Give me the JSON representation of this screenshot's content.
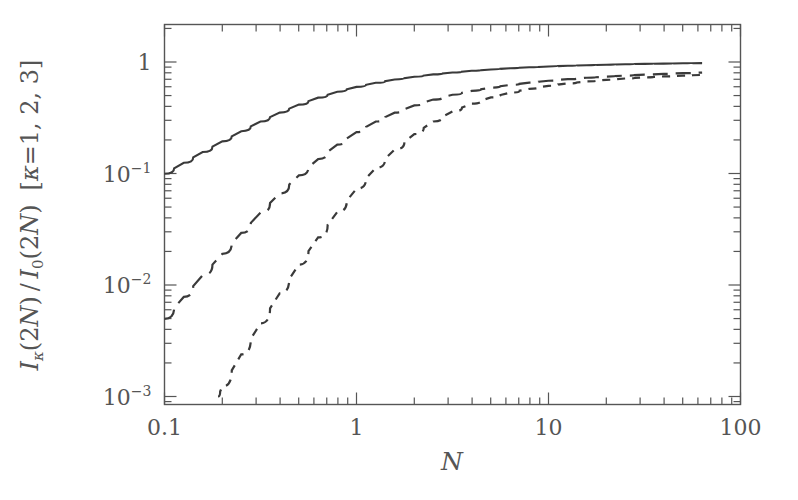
{
  "figure": {
    "background_color": "#ffffff",
    "frame_color": "#555555",
    "curve_color": "#3a3a3a"
  },
  "chart_data": {
    "type": "line",
    "title": "",
    "subtitle": "",
    "xlabel": "N",
    "ylabel": "I_κ(2N)/I_0(2N)  [κ=1, 2, 3]",
    "xscale": "log",
    "yscale": "log",
    "xlim": [
      0.1,
      100
    ],
    "ylim": [
      0.001,
      1.6
    ],
    "grid": false,
    "legend": "none",
    "xticks": [
      0.1,
      1,
      10,
      100
    ],
    "xtick_labels": [
      "0.1",
      "1",
      "10",
      "100"
    ],
    "yticks": [
      1,
      0.1,
      0.01,
      0.001
    ],
    "ytick_labels": [
      "1",
      "10⁻¹",
      "10⁻²",
      "10⁻³"
    ],
    "ytick_mantissas": [
      "1",
      "10",
      "10",
      "10"
    ],
    "ytick_exponents": [
      "",
      "-1",
      "-2",
      "-3"
    ],
    "minor_ticks": true,
    "series": [
      {
        "name": "κ = 1",
        "linestyle": "solid",
        "x": [
          0.1,
          0.126,
          0.158,
          0.2,
          0.251,
          0.316,
          0.398,
          0.501,
          0.631,
          0.794,
          1.0,
          1.26,
          1.58,
          2.0,
          2.51,
          3.16,
          3.98,
          5.01,
          6.31,
          7.94,
          10.0,
          12.6,
          15.8,
          20.0,
          25.1,
          31.6,
          39.8,
          50.1,
          63.1
        ],
        "y": [
          0.0995,
          0.1249,
          0.1558,
          0.1942,
          0.2395,
          0.2925,
          0.3517,
          0.4149,
          0.4789,
          0.5412,
          0.5984,
          0.6506,
          0.6968,
          0.7378,
          0.7741,
          0.8058,
          0.8335,
          0.8576,
          0.8783,
          0.8963,
          0.9117,
          0.9251,
          0.9365,
          0.9462,
          0.9546,
          0.9617,
          0.9678,
          0.9731,
          0.9775
        ]
      },
      {
        "name": "κ = 2",
        "linestyle": "long-dash",
        "x": [
          0.1,
          0.126,
          0.158,
          0.2,
          0.251,
          0.316,
          0.398,
          0.501,
          0.631,
          0.794,
          1.0,
          1.26,
          1.58,
          2.0,
          2.51,
          3.16,
          3.98,
          5.01,
          6.31,
          7.94,
          10.0,
          12.6,
          15.8,
          20.0,
          25.1,
          31.6,
          39.8,
          50.1,
          63.1
        ],
        "y": [
          0.00497,
          0.00782,
          0.01223,
          0.01902,
          0.0293,
          0.0445,
          0.0663,
          0.0961,
          0.1347,
          0.1816,
          0.2351,
          0.2926,
          0.351,
          0.4076,
          0.4604,
          0.5084,
          0.5513,
          0.5894,
          0.623,
          0.6526,
          0.6788,
          0.7018,
          0.7221,
          0.74,
          0.7558,
          0.7698,
          0.7822,
          0.7933,
          0.8032
        ]
      },
      {
        "name": "κ = 3",
        "linestyle": "short-dash",
        "x": [
          0.19,
          0.2,
          0.251,
          0.316,
          0.398,
          0.501,
          0.631,
          0.794,
          1.0,
          1.26,
          1.58,
          2.0,
          2.51,
          3.16,
          3.98,
          5.01,
          6.31,
          7.94,
          10.0,
          12.6,
          15.8,
          20.0,
          25.1,
          31.6,
          39.8,
          50.1,
          63.1
        ],
        "y": [
          0.001,
          0.00123,
          0.00239,
          0.00453,
          0.00842,
          0.01524,
          0.02671,
          0.0451,
          0.0729,
          0.1123,
          0.164,
          0.2257,
          0.2927,
          0.3599,
          0.4234,
          0.4809,
          0.5313,
          0.5748,
          0.6118,
          0.6432,
          0.6698,
          0.6924,
          0.7117,
          0.7283,
          0.7426,
          0.755,
          0.7659
        ]
      }
    ],
    "annotations": []
  }
}
